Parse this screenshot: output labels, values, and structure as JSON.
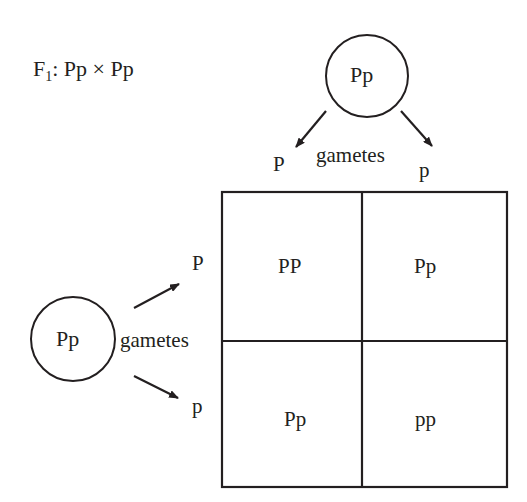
{
  "title": {
    "prefix": "F",
    "subscript": "1",
    "cross": ": Pp × Pp"
  },
  "top_parent": {
    "genotype": "Pp",
    "gametes_label": "gametes",
    "gametes": [
      "P",
      "p"
    ]
  },
  "left_parent": {
    "genotype": "Pp",
    "gametes_label": "gametes",
    "gametes": [
      "P",
      "p"
    ]
  },
  "punnett": {
    "cells": [
      [
        "PP",
        "Pp"
      ],
      [
        "Pp",
        "pp"
      ]
    ]
  },
  "colors": {
    "ink": "#231f20",
    "background": "#ffffff"
  }
}
